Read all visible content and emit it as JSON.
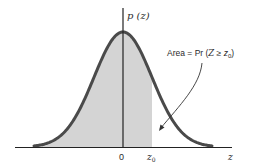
{
  "figure": {
    "y_axis_label": "p (z)",
    "x_axis_label": "z",
    "origin_label": "0",
    "z0_label_main": "z",
    "z0_label_sub": "0",
    "annotation": {
      "prefix": "Area = Pr (",
      "var": "Z",
      "op": " ≥ ",
      "z": "z",
      "sub": "0",
      "suffix": ")"
    },
    "colors": {
      "curve": "#4a4a4a",
      "shade": "#d4d4d4",
      "axis": "#222222",
      "background": "#ffffff"
    },
    "curve": {
      "type": "normal-density",
      "mean": 0,
      "shaded_region": "z <= z0"
    }
  }
}
